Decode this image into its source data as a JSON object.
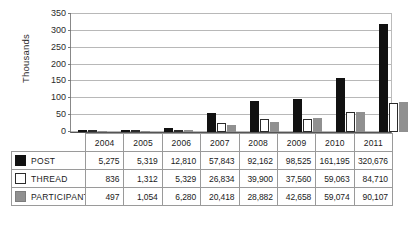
{
  "chart_data": {
    "type": "bar",
    "title": "",
    "xlabel": "",
    "ylabel": "Thousands",
    "ylim": [
      0,
      350
    ],
    "yticks": [
      0,
      50,
      100,
      150,
      200,
      250,
      300,
      350
    ],
    "grid": true,
    "legend_position": "data-table",
    "categories": [
      "2004",
      "2005",
      "2006",
      "2007",
      "2008",
      "2009",
      "2010",
      "2011"
    ],
    "value_scale": "thousands",
    "series": [
      {
        "name": "POST",
        "color": "#111111",
        "values": [
          5275,
          5319,
          12810,
          57843,
          92162,
          98525,
          161195,
          320676
        ],
        "labels": [
          "5,275",
          "5,319",
          "12,810",
          "57,843",
          "92,162",
          "98,525",
          "161,195",
          "320,676"
        ]
      },
      {
        "name": "THREAD",
        "color": "#ffffff",
        "values": [
          836,
          1312,
          5329,
          26834,
          39900,
          37560,
          59063,
          84710
        ],
        "labels": [
          "836",
          "1,312",
          "5,329",
          "26,834",
          "39,900",
          "37,560",
          "59,063",
          "84,710"
        ]
      },
      {
        "name": "PARTICIPANT",
        "color": "#909090",
        "values": [
          497,
          1054,
          6280,
          20418,
          28882,
          42658,
          59074,
          90107
        ],
        "labels": [
          "497",
          "1,054",
          "6,280",
          "20,418",
          "28,882",
          "42,658",
          "59,074",
          "90,107"
        ]
      }
    ]
  }
}
